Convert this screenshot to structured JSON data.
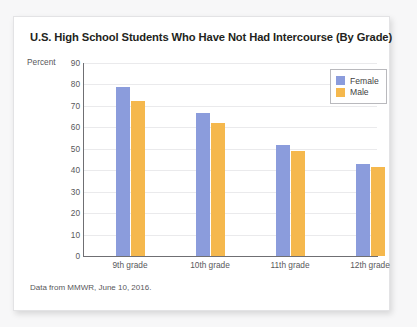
{
  "card": {
    "title": "U.S. High School Students Who Have Not Had Intercourse (By Grade)",
    "footer": "Data from MMWR, June 10, 2016."
  },
  "chart_data": {
    "type": "bar",
    "title": "U.S. High School Students Who Have Not Had Intercourse (By Grade)",
    "xlabel": "",
    "ylabel": "Percent",
    "ylim": [
      0,
      90
    ],
    "yticks": [
      0,
      10,
      20,
      30,
      40,
      50,
      60,
      70,
      80,
      90
    ],
    "grid": true,
    "legend_position": "top-right",
    "categories": [
      "9th grade",
      "10th grade",
      "11th grade",
      "12th grade"
    ],
    "series": [
      {
        "name": "Female",
        "color": "#8b9cdc",
        "values": [
          79,
          66.5,
          52,
          43
        ]
      },
      {
        "name": "Male",
        "color": "#f5b84d",
        "values": [
          72.5,
          62,
          49,
          41.5
        ]
      }
    ],
    "annotation": "Data from MMWR, June 10, 2016."
  }
}
